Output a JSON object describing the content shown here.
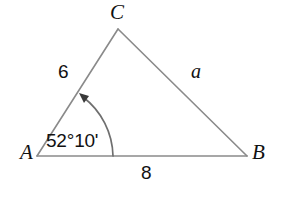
{
  "figure": {
    "type": "triangle-geometry-diagram",
    "background_color": "#ffffff",
    "stroke_color": "#8a8a8a",
    "text_color": "#111111",
    "vertices": {
      "A": {
        "label": "A",
        "x": 37,
        "y": 156
      },
      "B": {
        "label": "B",
        "x": 247,
        "y": 156
      },
      "C": {
        "label": "C",
        "x": 118,
        "y": 29
      }
    },
    "sides": {
      "AC": {
        "label": "6",
        "value": 6,
        "style": "upright"
      },
      "CB": {
        "label": "a",
        "value": null,
        "style": "italic"
      },
      "AB": {
        "label": "8",
        "value": 8,
        "style": "upright"
      }
    },
    "angle": {
      "at_vertex": "A",
      "label": "52°10'",
      "degrees": 52,
      "minutes": 10,
      "arc_radius": 76,
      "arrow": "arc-arrowhead-icon"
    }
  }
}
